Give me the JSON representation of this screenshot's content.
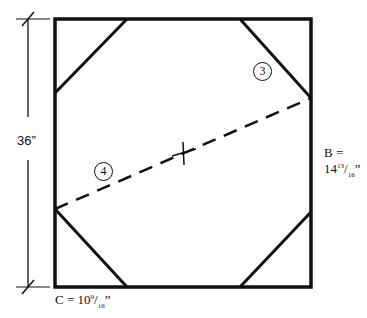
{
  "diagram": {
    "height_label": "36”",
    "b_label_line1": "B =",
    "b_label_line2_whole": "14",
    "b_label_line2_num": "13",
    "b_label_line2_den": "16",
    "b_label_line2_suffix": "”",
    "c_label_prefix": "C = 10",
    "c_label_num": "9",
    "c_label_den": "16",
    "c_label_suffix": "”",
    "callouts": [
      {
        "label": "3"
      },
      {
        "label": "4"
      }
    ],
    "stroke_color": "#111111",
    "background_color": "#ffffff"
  }
}
